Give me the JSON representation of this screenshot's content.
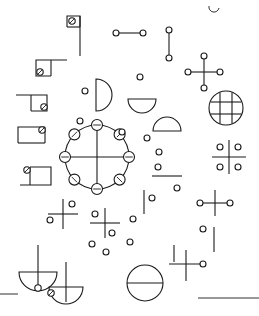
{
  "canvas": {
    "width": 259,
    "height": 316,
    "background": "#ffffff",
    "ink": "#1a1a1a",
    "stroke_width": 1.1,
    "title": "abstract-line-glyph-composition"
  },
  "palette": {
    "ink": "#1a1a1a",
    "paper": "#ffffff"
  },
  "figures": {
    "flag_top": {
      "name": "flag-glyph",
      "pole": {
        "x": 80,
        "y1": 16,
        "y2": 56
      },
      "banner": {
        "points": "67,27 67,16 80,16 80,27"
      },
      "node": {
        "cx": 72,
        "cy": 21,
        "r": 3.2,
        "slashed": true
      }
    },
    "bracket_upper_left": {
      "name": "bracket-glyph-upper",
      "path": "M 67,60 L 36,60 L 36,76 L 51,76",
      "node": {
        "cx": 40,
        "cy": 72,
        "r": 3.2,
        "slashed": true
      }
    },
    "bracket_mid_left": {
      "name": "bracket-glyph-mid",
      "path": "M 16,95 L 47,95 L 47,111 L 31,111",
      "node": {
        "cx": 44,
        "cy": 108,
        "r": 3.2,
        "slashed": true
      }
    },
    "bracket_low_left": {
      "name": "bracket-glyph-low",
      "path": "M 16,143 L 22,143 L 22,126 L 45,126",
      "node": {
        "cx": 42,
        "cy": 129,
        "r": 3.2,
        "slashed": true
      }
    },
    "bracket_bottom_left": {
      "name": "bracket-glyph-bottom",
      "path": "M 20,185 L 51,185 L 51,165 L 29,165",
      "node": {
        "cx": 26,
        "cy": 168,
        "r": 3.2,
        "slashed": true
      }
    },
    "dumbbell_horizontal": {
      "name": "dumbbell-horizontal",
      "x1": 116,
      "x2": 143,
      "y": 33,
      "r": 3.0
    },
    "dumbbell_vertical": {
      "name": "dumbbell-vertical",
      "x": 169,
      "y1": 30,
      "y2": 58,
      "r": 3.0
    },
    "cross_four_node": {
      "name": "cross-four-node",
      "cx": 204,
      "cy": 72,
      "arm": 16,
      "r": 3.0
    },
    "grid_circle": {
      "name": "grid-circle",
      "cx": 226,
      "cy": 108,
      "r": 17,
      "inner_lines": 4
    },
    "semicircle_left": {
      "name": "semicircle-right-facing",
      "cx": 100,
      "cy": 95,
      "r": 16,
      "orientation": "right"
    },
    "semicircle_bowl_small": {
      "name": "semicircle-bowl-small",
      "cx": 142,
      "cy": 105,
      "r": 14,
      "orientation": "down"
    },
    "semicircle_bowl_mid": {
      "name": "semicircle-bowl-mid",
      "cx": 167,
      "cy": 123,
      "r": 14,
      "orientation": "up"
    },
    "mandala": {
      "name": "mandala-ring",
      "cx": 97,
      "cy": 157,
      "r": 32,
      "node_count": 8,
      "node_r": 5.5,
      "cross": true
    },
    "cross_dots_upper": {
      "name": "cross-with-dots-upper",
      "cx": 63,
      "cy": 214,
      "arm": 15,
      "dots": [
        {
          "dx": 9,
          "dy": -10
        },
        {
          "dx": -13,
          "dy": 6
        }
      ],
      "dot_r": 3.0
    },
    "cross_dots_lower": {
      "name": "cross-with-dots-lower",
      "cx": 105,
      "cy": 223,
      "arm": 15,
      "dots": [
        {
          "dx": -10,
          "dy": -9
        },
        {
          "dx": 7,
          "dy": 10
        }
      ],
      "dot_r": 3.0
    },
    "quad_dot_cross": {
      "name": "quad-dot-cross",
      "cx": 229,
      "cy": 157,
      "arm": 17,
      "dot_r": 3.0,
      "dot_offset": 9
    },
    "cross_with_node_right": {
      "name": "cross-with-right-node",
      "cx": 215,
      "cy": 203,
      "arm": 15,
      "r": 3.0
    },
    "cross_with_node_bottom": {
      "name": "cross-with-right-node-bottom",
      "cx": 186,
      "cy": 264,
      "arm": 17,
      "r": 3.0
    },
    "bowl_pin_left": {
      "name": "bowl-with-pin-left",
      "cx": 38,
      "cy": 272,
      "r": 19,
      "stem_top": 245,
      "node_r": 3.2
    },
    "bowl_pin_mid": {
      "name": "bowl-with-pin-mid",
      "cx": 66,
      "cy": 287,
      "r": 17,
      "stem_top": 262,
      "node_r": 3.2
    },
    "circle_bisected": {
      "name": "circle-bisected",
      "cx": 145,
      "cy": 283,
      "r": 18
    },
    "segment_right_upper": {
      "name": "segment-short-upper",
      "x1": 152,
      "x2": 182,
      "y": 176
    },
    "segment_vertical_a": {
      "name": "segment-vertical-a",
      "x": 144,
      "y1": 190,
      "y2": 214
    },
    "segment_vertical_b": {
      "name": "segment-vertical-b",
      "x": 214,
      "y1": 227,
      "y2": 252
    },
    "segment_vertical_c": {
      "name": "segment-vertical-c",
      "x": 174,
      "y1": 245,
      "y2": 262
    },
    "segment_bottom_left": {
      "name": "segment-bottom-left",
      "x1": 0,
      "x2": 18,
      "y": 294
    },
    "segment_bottom_right": {
      "name": "segment-bottom-right",
      "x1": 198,
      "x2": 259,
      "y": 298
    },
    "segment_top_right_arc": {
      "name": "arc-fragment-top-right",
      "cx": 214,
      "cy": 7,
      "r": 5
    }
  },
  "loose_dots": [
    {
      "name": "dot-a",
      "cx": 85,
      "cy": 91,
      "r": 3.0
    },
    {
      "name": "dot-b",
      "cx": 140,
      "cy": 77,
      "r": 3.0
    },
    {
      "name": "dot-c",
      "cx": 122,
      "cy": 132,
      "r": 3.0
    },
    {
      "name": "dot-d",
      "cx": 147,
      "cy": 138,
      "r": 3.0
    },
    {
      "name": "dot-e",
      "cx": 159,
      "cy": 152,
      "r": 3.0
    },
    {
      "name": "dot-f",
      "cx": 158,
      "cy": 167,
      "r": 3.0
    },
    {
      "name": "dot-g",
      "cx": 177,
      "cy": 188,
      "r": 3.0
    },
    {
      "name": "dot-h",
      "cx": 152,
      "cy": 198,
      "r": 3.0
    },
    {
      "name": "dot-i",
      "cx": 133,
      "cy": 219,
      "r": 3.0
    },
    {
      "name": "dot-j",
      "cx": 203,
      "cy": 229,
      "r": 3.0
    },
    {
      "name": "dot-k",
      "cx": 92,
      "cy": 244,
      "r": 3.0
    },
    {
      "name": "dot-l",
      "cx": 106,
      "cy": 252,
      "r": 3.0
    },
    {
      "name": "dot-m",
      "cx": 130,
      "cy": 242,
      "r": 3.0
    },
    {
      "name": "dot-n",
      "cx": 80,
      "cy": 121,
      "r": 3.0
    }
  ]
}
